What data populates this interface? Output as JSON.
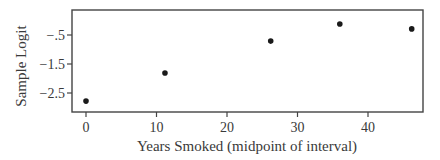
{
  "chart_data": {
    "type": "scatter",
    "title": "",
    "xlabel": "Years Smoked (midpoint of interval)",
    "ylabel": "Sample Logit",
    "x": [
      0,
      11.2,
      26.2,
      36.0,
      46.2
    ],
    "y": [
      -2.78,
      -1.81,
      -0.71,
      -0.12,
      -0.29
    ],
    "xlim": [
      -2,
      48
    ],
    "ylim": [
      -3.05,
      0.35
    ],
    "xticks": [
      0,
      10,
      20,
      30,
      40
    ],
    "xtick_labels": [
      "0",
      "10",
      "20",
      "30",
      "40"
    ],
    "yticks": [
      -0.5,
      -1.5,
      -2.5
    ],
    "ytick_labels": [
      "−.5",
      "−1.5",
      "−2.5"
    ],
    "grid": false,
    "legend": null,
    "marker_color": "#1a1a1a"
  }
}
